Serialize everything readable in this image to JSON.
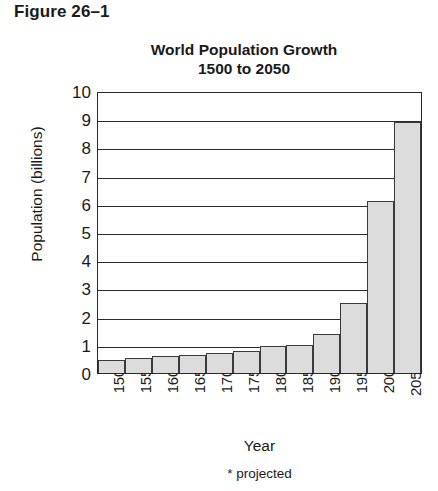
{
  "figure": {
    "label": "Figure 26–1"
  },
  "chart_data": {
    "type": "bar",
    "title": "World Population Growth",
    "subtitle": "1500 to 2050",
    "title_lines": [
      "World Population Growth",
      "1500 to 2050"
    ],
    "xlabel": "Year",
    "ylabel": "Population (billions)",
    "categories": [
      "1500",
      "1550",
      "1600",
      "1650",
      "1700",
      "1750",
      "1800",
      "1850",
      "1900",
      "1950",
      "2000",
      "2050*"
    ],
    "values": [
      0.45,
      0.55,
      0.6,
      0.65,
      0.7,
      0.78,
      0.95,
      1.0,
      1.4,
      2.5,
      6.1,
      8.9
    ],
    "ylim": [
      0,
      10
    ],
    "yticks": [
      10,
      9,
      8,
      7,
      6,
      5,
      4,
      3,
      2,
      1,
      0
    ],
    "ytick_labels": [
      "10",
      "9",
      "8",
      "7",
      "6",
      "5",
      "4",
      "3",
      "2",
      "1",
      "0"
    ],
    "grid": true,
    "grid_axis": "y",
    "legend": "none",
    "annotation": "* projected",
    "bar_fill_color": "#dcdcdc",
    "bar_border_color": "#3a3a3a",
    "axis_color": "#2b2b2b",
    "background_color": "#ffffff"
  },
  "footnote": {
    "text": "* projected"
  }
}
